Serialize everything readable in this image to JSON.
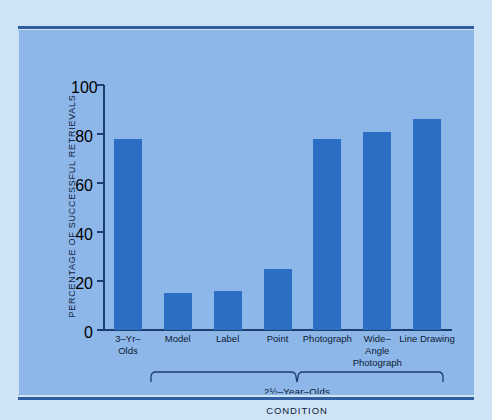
{
  "figure": {
    "background_color": "#cfe3f7",
    "panel_color": "#8cb7e8",
    "bar_color": "#2b6fc4",
    "axis_color": "#1d3f6e",
    "rule_color": "#2f5fa0"
  },
  "chart_data": {
    "type": "bar",
    "title": "",
    "xlabel": "CONDITION",
    "ylabel": "PERCENTAGE OF SUCCESSFUL RETRIEVALS",
    "categories": [
      "3–Yr–\nOlds",
      "Model",
      "Label",
      "Point",
      "Photograph",
      "Wide–\nAngle\nPhotograph",
      "Line Drawing"
    ],
    "category_lines": [
      [
        "3–Yr–",
        "Olds"
      ],
      [
        "Model"
      ],
      [
        "Label"
      ],
      [
        "Point"
      ],
      [
        "Photograph"
      ],
      [
        "Wide–",
        "Angle",
        "Photograph"
      ],
      [
        "Line Drawing"
      ]
    ],
    "values": [
      78,
      15,
      16,
      25,
      78,
      81,
      86
    ],
    "ylim": [
      0,
      100
    ],
    "yticks": [
      0,
      20,
      40,
      60,
      80,
      100
    ],
    "ytick_labels": [
      "0",
      "20",
      "40",
      "60",
      "80",
      "100"
    ],
    "grid": false,
    "legend": null,
    "annotations": [
      {
        "type": "group-bracket",
        "label": "2½–Year–Olds",
        "spans_categories": [
          "Model",
          "Label",
          "Point",
          "Photograph",
          "Wide–Angle Photograph",
          "Line Drawing"
        ]
      }
    ]
  },
  "axis": {
    "y_title": "PERCENTAGE OF SUCCESSFUL RETRIEVALS",
    "x_title": "CONDITION"
  },
  "bracket": {
    "label": "2½–Year–Olds"
  }
}
